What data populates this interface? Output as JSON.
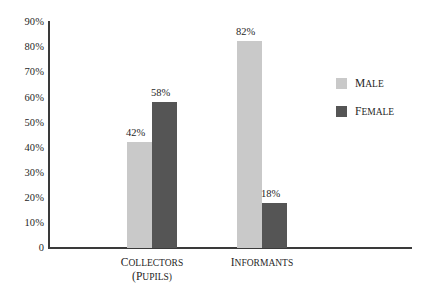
{
  "chart_data": {
    "type": "bar",
    "title": "",
    "subtitle": "",
    "xlabel": "",
    "ylabel": "",
    "categories": [
      "Collectors (pupils)",
      "Informants"
    ],
    "category_labels": [
      {
        "line1": "Collectors",
        "line2": "(pupils)"
      },
      {
        "line1": "Informants",
        "line2": ""
      }
    ],
    "series": [
      {
        "name": "Male",
        "color": "#c9c9c9",
        "values": [
          42,
          82
        ],
        "value_labels": [
          "42%",
          "82%"
        ]
      },
      {
        "name": "Female",
        "color": "#555555",
        "values": [
          58,
          18
        ],
        "value_labels": [
          "58%",
          "18%"
        ]
      }
    ],
    "ylim": [
      0,
      90
    ],
    "ytick_values": [
      90,
      80,
      70,
      60,
      50,
      40,
      30,
      20,
      10,
      0
    ],
    "ytick_labels": [
      "90%",
      "80%",
      "70%",
      "60%",
      "50%",
      "40%",
      "30%",
      "20%",
      "10%",
      "0"
    ],
    "grid": false,
    "legend_position": "right",
    "legend_entries": [
      {
        "label": "Male",
        "color": "#c9c9c9"
      },
      {
        "label": "Female",
        "color": "#555555"
      }
    ],
    "axis_color": "#3a3a3a",
    "background_color": "#ffffff"
  }
}
